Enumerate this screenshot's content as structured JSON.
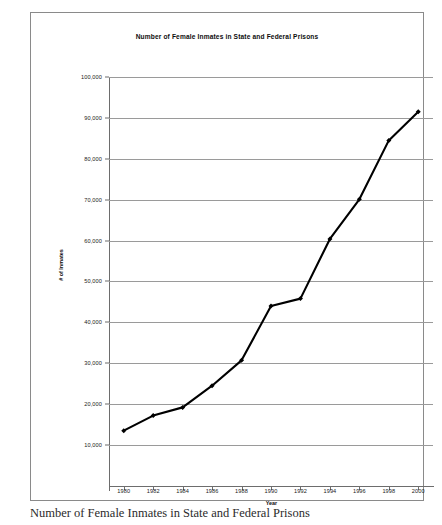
{
  "caption": "Number of Female Inmates in State and Federal Prisons",
  "chart_data": {
    "type": "line",
    "title": "Number of Female Inmates in State and Federal Prisons",
    "xlabel": "Year",
    "ylabel": "# of Inmates",
    "x": [
      1980,
      1982,
      1984,
      1986,
      1988,
      1990,
      1992,
      1994,
      1996,
      1998,
      2000
    ],
    "values": [
      13500,
      17200,
      19200,
      24500,
      30700,
      44000,
      45800,
      60400,
      70100,
      84500,
      91500
    ],
    "categories": [
      "1980",
      "1982",
      "1984",
      "1986",
      "1988",
      "1990",
      "1992",
      "1994",
      "1996",
      "1998",
      "2000"
    ],
    "xlim": [
      1979,
      2001
    ],
    "ylim": [
      10000,
      100000
    ],
    "xticks": [
      "1980",
      "1982",
      "1984",
      "1986",
      "1988",
      "1990",
      "1992",
      "1994",
      "1996",
      "1998",
      "2000"
    ],
    "yticks": [
      "10,000",
      "20,000",
      "30,000",
      "40,000",
      "50,000",
      "60,000",
      "70,000",
      "80,000",
      "90,000",
      "100,000"
    ],
    "ytick_values": [
      10000,
      20000,
      30000,
      40000,
      50000,
      60000,
      70000,
      80000,
      90000,
      100000
    ],
    "grid": "horizontal",
    "legend": "none",
    "series_color": "#000000",
    "grid_color": "#9a9a9a",
    "marker": "diamond"
  }
}
